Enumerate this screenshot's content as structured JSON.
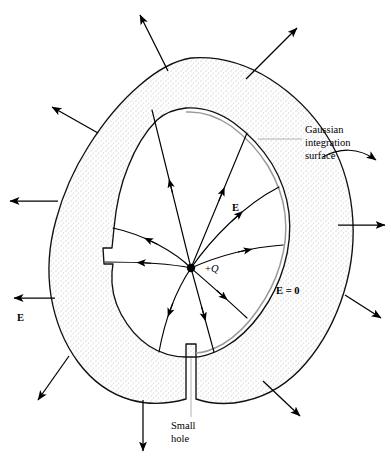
{
  "figure": {
    "background_color": "#ffffff",
    "line_color": "#111111",
    "stipple_color": "#b4b4b4",
    "gaussian_color": "#9a9a9a",
    "leader_color": "#a8a8a8",
    "width": 391,
    "height": 462
  },
  "labels": {
    "gaussian": {
      "line1": "Gaussian",
      "line2": "integration",
      "line3": "surface",
      "x": 305,
      "y": 133
    },
    "small_hole": {
      "line1": "Small",
      "line2": "hole",
      "x": 171,
      "y": 429
    },
    "charge": {
      "sign": "+",
      "symbol": "Q",
      "x": 205,
      "y": 272
    },
    "e_inside": {
      "text": "E",
      "x": 232,
      "y": 211
    },
    "e_outside": {
      "text": "E",
      "x": 17,
      "y": 321
    },
    "e_zero": {
      "text": "E = 0",
      "x": 276,
      "y": 294
    }
  },
  "geometry": {
    "charge_point": {
      "x": 191,
      "y": 268,
      "radius": 4.2
    },
    "outer_boundary": "M 191 58 C 218 56 246 64 270 79 C 292 93 312 112 327 136 C 341 158 349 183 352 210 C 355 238 352 266 344 292 C 336 318 323 343 306 363 C 289 383 268 396 245 401 C 228 405 211 404 196 399 L 196 357 L 186 357 L 186 399 C 168 404 149 405 131 400 C 110 394 92 381 78 362 C 64 343 55 320 51 296 C 47 271 49 245 56 220 C 63 194 74 169 88 147 C 103 123 120 102 140 85 C 155 72 172 61 191 58 Z",
    "inner_boundary": "M 186 108 C 203 107 220 113 234 123 C 249 134 262 148 272 164 C 281 179 287 196 289 213 C 291 231 289 249 284 266 C 279 283 271 299 261 313 C 251 327 239 339 225 347 C 213 354 201 357 196 357 L 196 344 L 186 344 L 186 357 C 173 357 160 353 149 346 C 137 338 128 327 121 314 C 114 301 111 287 112 272 L 113 264 L 104 264 L 103 248 L 112 248 L 114 228 C 116 207 120 186 128 167 C 135 149 145 132 157 120 C 166 112 176 109 186 108 Z",
    "gaussian_surface": "M 186 112 C 202 111 218 117 231 126 C 246 137 258 150 268 166 C 277 181 283 197 285 214 C 287 231 285 249 280 265 C 275 282 267 297 257 311 C 248 324 236 336 223 344 C 212 350 201 353 196 353",
    "field_lines": [
      {
        "path": "M 191 268 L 152 110",
        "arrow_t": 0.52,
        "name": "field-line-up-left"
      },
      {
        "path": "M 191 268 L 247 133",
        "arrow_t": 0.55,
        "name": "field-line-up-right"
      },
      {
        "path": "M 191 268 C 212 238 244 205 279 187",
        "arrow_t": 0.58,
        "name": "field-line-upper-right-curve"
      },
      {
        "path": "M 191 268 C 211 259 244 248 283 245",
        "arrow_t": 0.6,
        "name": "field-line-right"
      },
      {
        "path": "M 191 268 C 176 253 146 235 113 228",
        "arrow_t": 0.55,
        "name": "field-line-left-upper"
      },
      {
        "path": "M 191 268 C 172 264 140 262 105 262",
        "arrow_t": 0.55,
        "name": "field-line-left"
      },
      {
        "path": "M 191 268 C 177 289 165 319 159 352",
        "arrow_t": 0.52,
        "name": "field-line-down-left"
      },
      {
        "path": "M 191 268 L 214 352",
        "arrow_t": 0.55,
        "name": "field-line-down"
      },
      {
        "path": "M 191 268 C 206 281 228 300 247 318",
        "arrow_t": 0.55,
        "name": "field-line-down-right"
      }
    ],
    "external_arrows": [
      {
        "path": "M 168 71 L 140 15",
        "name": "ext-arrow-top-left",
        "curved": false
      },
      {
        "path": "M 246 79 L 297 28",
        "name": "ext-arrow-top-right",
        "curved": false
      },
      {
        "path": "M 98 133 L 52 107",
        "name": "ext-arrow-upper-left",
        "curved": false
      },
      {
        "path": "M 58 201 L 10 201",
        "name": "ext-arrow-left-upper",
        "curved": false
      },
      {
        "path": "M 55 298 L 14 298",
        "name": "ext-arrow-left-lower",
        "curved": false
      },
      {
        "path": "M 69 356 L 38 400",
        "name": "ext-arrow-lower-left",
        "curved": false
      },
      {
        "path": "M 143 400 L 143 451",
        "name": "ext-arrow-bottom",
        "curved": false
      },
      {
        "path": "M 263 381 L 300 416",
        "name": "ext-arrow-lower-right",
        "curved": false
      },
      {
        "path": "M 345 295 L 381 318",
        "name": "ext-arrow-right-lower",
        "curved": false
      },
      {
        "path": "M 323 157 C 339 148 358 147 376 160",
        "name": "ext-arrow-right-upper",
        "curved": true
      },
      {
        "path": "M 338 225 L 385 225",
        "name": "ext-arrow-right",
        "curved": false
      }
    ],
    "leaders": [
      {
        "path": "M 302 139 L 258 139",
        "name": "leader-gaussian"
      },
      {
        "path": "M 191 417 L 191 358",
        "name": "leader-small-hole"
      }
    ]
  }
}
